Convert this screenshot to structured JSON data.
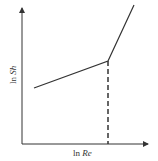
{
  "diagram": {
    "xlabel_prefix": "ln ",
    "xlabel_var": "Re",
    "ylabel_prefix": "ln ",
    "ylabel_var": "Sh",
    "colors": {
      "line": "#333333",
      "background": "#ffffff"
    }
  }
}
